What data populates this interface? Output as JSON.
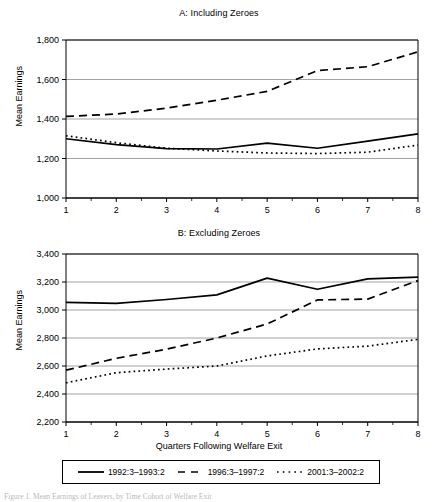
{
  "figure": {
    "caption": "Figure 1. Mean Earnings of Leavers, by Time Cohort of Welfare Exit"
  },
  "axis": {
    "y_label": "Mean Earnings",
    "x_title": "Quarters Following Welfare Exit",
    "x_ticks": [
      "1",
      "2",
      "3",
      "4",
      "5",
      "6",
      "7",
      "8"
    ],
    "panelA_y_ticks": [
      "1,000",
      "1,200",
      "1,400",
      "1,600",
      "1,800"
    ],
    "panelB_y_ticks": [
      "2,200",
      "2,400",
      "2,600",
      "2,800",
      "3,000",
      "3,200",
      "3,400"
    ]
  },
  "legend": {
    "items": [
      {
        "label": "1992:3–1993:2",
        "style": "solid",
        "swatch": "solid-line-swatch"
      },
      {
        "label": "1996:3–1997:2",
        "style": "dashed",
        "swatch": "dashed-line-swatch"
      },
      {
        "label": "2001:3–2002:2",
        "style": "dotted",
        "swatch": "dotted-line-swatch"
      }
    ]
  },
  "chart_data": [
    {
      "type": "line",
      "title": "A: Including Zeroes",
      "xlabel": "",
      "ylabel": "Mean Earnings",
      "x": [
        1,
        2,
        3,
        4,
        5,
        6,
        7,
        8
      ],
      "xlim": [
        1,
        8
      ],
      "ylim": [
        1000,
        1800
      ],
      "ytick_step": 200,
      "grid": true,
      "legend_position": "bottom",
      "series": [
        {
          "name": "1992:3–1993:2",
          "style": "solid",
          "values": [
            1300,
            1270,
            1250,
            1248,
            1278,
            1252,
            1288,
            1325
          ]
        },
        {
          "name": "1996:3–1997:2",
          "style": "dashed",
          "values": [
            1413,
            1425,
            1455,
            1495,
            1540,
            1645,
            1665,
            1740
          ]
        },
        {
          "name": "2001:3–2002:2",
          "style": "dotted",
          "values": [
            1315,
            1280,
            1252,
            1238,
            1228,
            1225,
            1232,
            1268
          ]
        }
      ]
    },
    {
      "type": "line",
      "title": "B: Excluding Zeroes",
      "xlabel": "Quarters Following Welfare Exit",
      "ylabel": "Mean Earnings",
      "x": [
        1,
        2,
        3,
        4,
        5,
        6,
        7,
        8
      ],
      "xlim": [
        1,
        8
      ],
      "ylim": [
        2200,
        3400
      ],
      "ytick_step": 200,
      "grid": true,
      "legend_position": "bottom",
      "series": [
        {
          "name": "1992:3–1993:2",
          "style": "solid",
          "values": [
            3055,
            3048,
            3075,
            3108,
            3228,
            3148,
            3222,
            3235
          ]
        },
        {
          "name": "1996:3–1997:2",
          "style": "dashed",
          "values": [
            2570,
            2655,
            2720,
            2800,
            2900,
            3072,
            3078,
            3210
          ]
        },
        {
          "name": "2001:3–2002:2",
          "style": "dotted",
          "values": [
            2480,
            2552,
            2578,
            2600,
            2672,
            2722,
            2742,
            2790
          ]
        }
      ]
    }
  ]
}
